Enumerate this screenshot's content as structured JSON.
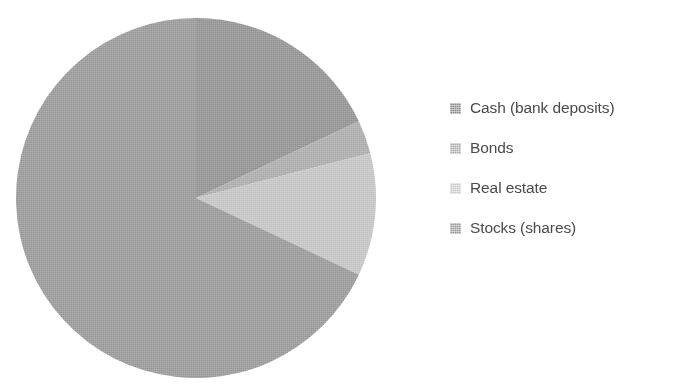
{
  "chart_data": {
    "type": "pie",
    "title": "",
    "subtitle": "",
    "xlabel": "",
    "ylabel": "",
    "legend_position": "right",
    "grid": false,
    "categories": [
      "Cash (bank deposits)",
      "Bonds",
      "Real estate",
      "Stocks (shares)"
    ],
    "values": [
      18,
      3,
      11,
      68
    ],
    "unit": "%",
    "start_angle_deg": 0,
    "direction": "clockwise",
    "slices": [
      {
        "label": "Cash (bank deposits)",
        "value": 18,
        "color": "#8e8e8e",
        "start_deg": 0,
        "end_deg": 64.8
      },
      {
        "label": "Bonds",
        "value": 3,
        "color": "#a8a8a8",
        "start_deg": 64.8,
        "end_deg": 75.6
      },
      {
        "label": "Real estate",
        "value": 11,
        "color": "#c2c2c2",
        "start_deg": 75.6,
        "end_deg": 115.2
      },
      {
        "label": "Stocks (shares)",
        "value": 68,
        "color": "#959595",
        "start_deg": 115.2,
        "end_deg": 360
      }
    ]
  },
  "legend": {
    "items": [
      {
        "label": "Cash (bank deposits)",
        "color": "#8a8a8a"
      },
      {
        "label": "Bonds",
        "color": "#adadad"
      },
      {
        "label": "Real estate",
        "color": "#c9c9c9"
      },
      {
        "label": "Stocks (shares)",
        "color": "#9a9a9a"
      }
    ]
  },
  "colors": {
    "background": "#ffffff",
    "text": "#4a4a4a",
    "cash": "#8e8e8e",
    "bonds": "#a8a8a8",
    "real_estate": "#c2c2c2",
    "stocks": "#959595"
  },
  "geometry": {
    "center_x": 196,
    "center_y": 198,
    "radius": 180
  }
}
